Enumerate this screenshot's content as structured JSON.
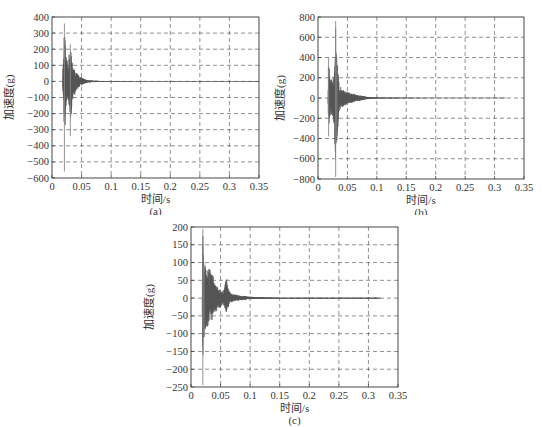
{
  "figure": {
    "panels": [
      {
        "id": "a",
        "caption": "(a)"
      },
      {
        "id": "b",
        "caption": "(b)"
      },
      {
        "id": "c",
        "caption": "(c)"
      }
    ]
  },
  "colors": {
    "signal": "#555555",
    "grid": "#444444",
    "axis": "#333333",
    "background": "#ffffff"
  },
  "chart_data": [
    {
      "type": "line",
      "panel": "(a)",
      "title": "",
      "xlabel": "时间/s",
      "ylabel": "加速度(g)",
      "xlim": [
        0,
        0.35
      ],
      "ylim": [
        -600,
        400
      ],
      "xticks": [
        0,
        0.05,
        0.1,
        0.15,
        0.2,
        0.25,
        0.3,
        0.35
      ],
      "xtick_labels": [
        "0",
        "0.05",
        "0.1",
        "0.15",
        "0.2",
        "0.25",
        "0.3",
        "0.35"
      ],
      "yticks": [
        400,
        300,
        200,
        100,
        0,
        -100,
        -200,
        -300,
        -400,
        -500,
        -600
      ],
      "ytick_labels": [
        "400",
        "300",
        "200",
        "100",
        "0",
        "−100",
        "−200",
        "−300",
        "−400",
        "−500",
        "−600"
      ],
      "grid": true,
      "grid_style": "dashed",
      "legend": null,
      "description": "Decaying shock acceleration signal; burst begins ~0.018 s, peaks ~+360 g at ~0.021 s and ~-560 g at ~0.021 s, second burst ~+230/-340 g at ~0.031 s, decays to ~0 by ~0.06 s",
      "envelope": {
        "t": [
          0.018,
          0.02,
          0.021,
          0.023,
          0.025,
          0.028,
          0.031,
          0.033,
          0.036,
          0.04,
          0.045,
          0.05,
          0.055,
          0.06,
          0.07,
          0.08,
          0.1,
          0.15,
          0.2,
          0.35
        ],
        "upper": [
          60,
          180,
          360,
          170,
          120,
          150,
          230,
          160,
          90,
          60,
          40,
          25,
          15,
          8,
          5,
          3,
          2,
          1,
          1,
          1
        ],
        "lower": [
          -60,
          -150,
          -560,
          -190,
          -120,
          -140,
          -340,
          -200,
          -110,
          -70,
          -40,
          -25,
          -15,
          -8,
          -5,
          -3,
          -2,
          -1,
          -1,
          -1
        ]
      }
    },
    {
      "type": "line",
      "panel": "(b)",
      "title": "",
      "xlabel": "时间/s",
      "ylabel": "加速度(g)",
      "xlim": [
        0,
        0.35
      ],
      "ylim": [
        -800,
        800
      ],
      "xticks": [
        0,
        0.05,
        0.1,
        0.15,
        0.2,
        0.25,
        0.3,
        0.35
      ],
      "xtick_labels": [
        "0",
        "0.05",
        "0.1",
        "0.15",
        "0.2",
        "0.25",
        "0.3",
        "0.35"
      ],
      "yticks": [
        800,
        600,
        400,
        200,
        0,
        -200,
        -400,
        -600,
        -800
      ],
      "ytick_labels": [
        "800",
        "600",
        "400",
        "200",
        "0",
        "−200",
        "−400",
        "−600",
        "−800"
      ],
      "grid": true,
      "grid_style": "dashed",
      "legend": null,
      "description": "Shock acceleration; first spike ~+400/-380 g at ~0.018 s, main spike ~+760/-780 g at ~0.030 s, decays with ringing to ~0 by ~0.09 s, trace ends ~0.32 s",
      "envelope": {
        "t": [
          0.017,
          0.018,
          0.02,
          0.024,
          0.028,
          0.03,
          0.032,
          0.036,
          0.04,
          0.05,
          0.06,
          0.07,
          0.08,
          0.09,
          0.1,
          0.15,
          0.2,
          0.32
        ],
        "upper": [
          100,
          400,
          230,
          180,
          250,
          760,
          400,
          150,
          90,
          60,
          45,
          30,
          15,
          8,
          4,
          2,
          1,
          1
        ],
        "lower": [
          -100,
          -380,
          -200,
          -170,
          -300,
          -780,
          -430,
          -160,
          -100,
          -60,
          -45,
          -30,
          -15,
          -8,
          -4,
          -2,
          -1,
          -1
        ]
      }
    },
    {
      "type": "line",
      "panel": "(c)",
      "title": "",
      "xlabel": "时间/s",
      "ylabel": "加速度(g)",
      "xlim": [
        0,
        0.35
      ],
      "ylim": [
        -250,
        200
      ],
      "xticks": [
        0,
        0.05,
        0.1,
        0.15,
        0.2,
        0.25,
        0.3,
        0.35
      ],
      "xtick_labels": [
        "0",
        "0.05",
        "0.1",
        "0.15",
        "0.2",
        "0.25",
        "0.3",
        "0.35"
      ],
      "yticks": [
        200,
        150,
        100,
        50,
        0,
        -50,
        -100,
        -150,
        -200,
        -250
      ],
      "ytick_labels": [
        "200",
        "150",
        "100",
        "50",
        "0",
        "−50",
        "−100",
        "−150",
        "−200",
        "−250"
      ],
      "grid": true,
      "grid_style": "dashed",
      "legend": null,
      "description": "Shock acceleration; main spike ~+195/-245 g at ~0.020 s, dense ringing ~±80 g to 0.04 s, secondary bump ~+60/-45 g at ~0.06 s, decays to ~0 by ~0.12 s, trace ends ~0.32 s",
      "envelope": {
        "t": [
          0.019,
          0.02,
          0.022,
          0.025,
          0.03,
          0.035,
          0.04,
          0.045,
          0.05,
          0.055,
          0.06,
          0.065,
          0.07,
          0.08,
          0.09,
          0.1,
          0.12,
          0.15,
          0.2,
          0.32
        ],
        "upper": [
          60,
          195,
          100,
          90,
          85,
          75,
          45,
          30,
          25,
          20,
          60,
          18,
          12,
          8,
          6,
          4,
          2,
          1,
          1,
          1
        ],
        "lower": [
          -60,
          -245,
          -110,
          -90,
          -75,
          -65,
          -45,
          -30,
          -25,
          -20,
          -45,
          -15,
          -10,
          -7,
          -5,
          -3,
          -2,
          -1,
          -1,
          -1
        ]
      }
    }
  ]
}
